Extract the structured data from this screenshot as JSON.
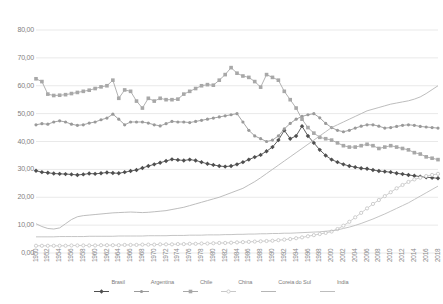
{
  "chart_data": {
    "type": "line",
    "title": "",
    "xlabel": "",
    "ylabel": "",
    "ylim": [
      0,
      80
    ],
    "ytick_step": 10,
    "grid": true,
    "legend_position": "bottom",
    "y_tick_labels": [
      "0,00",
      "10,00",
      "20,00",
      "30,00",
      "40,00",
      "50,00",
      "60,00",
      "70,00",
      "80,00"
    ],
    "x": [
      1950,
      1951,
      1952,
      1953,
      1954,
      1955,
      1956,
      1957,
      1958,
      1959,
      1960,
      1961,
      1962,
      1963,
      1964,
      1965,
      1966,
      1967,
      1968,
      1969,
      1970,
      1971,
      1972,
      1973,
      1974,
      1975,
      1976,
      1977,
      1978,
      1979,
      1980,
      1981,
      1982,
      1983,
      1984,
      1985,
      1986,
      1987,
      1988,
      1989,
      1990,
      1991,
      1992,
      1993,
      1994,
      1995,
      1996,
      1997,
      1998,
      1999,
      2000,
      2001,
      2002,
      2003,
      2004,
      2005,
      2006,
      2007,
      2008,
      2009,
      2010,
      2011,
      2012,
      2013,
      2014,
      2015,
      2016,
      2017,
      2018
    ],
    "x_tick_labels": [
      "1950",
      "1952",
      "1954",
      "1956",
      "1958",
      "1960",
      "1962",
      "1964",
      "1966",
      "1968",
      "1970",
      "1972",
      "1974",
      "1976",
      "1978",
      "1980",
      "1982",
      "1984",
      "1986",
      "1988",
      "1990",
      "1992",
      "1994",
      "1996",
      "1998",
      "2000",
      "2002",
      "2004",
      "2006",
      "2008",
      "2010",
      "2012",
      "2014",
      "2016",
      "2018"
    ],
    "series": [
      {
        "name": "Brasil",
        "color": "#4f4f4f",
        "marker": "diamond",
        "values": [
          29.5,
          29.0,
          28.8,
          28.5,
          28.4,
          28.3,
          28.2,
          28.0,
          28.2,
          28.5,
          28.4,
          28.6,
          28.9,
          28.7,
          28.6,
          29.0,
          29.4,
          29.8,
          30.5,
          31.2,
          31.8,
          32.4,
          33.0,
          33.6,
          33.4,
          33.2,
          33.5,
          33.2,
          32.6,
          32.0,
          31.6,
          31.2,
          31.0,
          31.2,
          31.8,
          32.6,
          33.5,
          34.4,
          35.2,
          36.5,
          38.0,
          40.5,
          44.0,
          41.0,
          42.0,
          45.5,
          42.0,
          39.5,
          37.0,
          35.0,
          33.5,
          32.6,
          31.8,
          31.2,
          30.8,
          30.4,
          30.2,
          29.8,
          29.4,
          29.2,
          29.0,
          28.6,
          28.3,
          28.0,
          27.7,
          27.4,
          27.2,
          27.0,
          26.8
        ]
      },
      {
        "name": "Argentina",
        "color": "#9a9a9a",
        "marker": "circle",
        "values": [
          46.0,
          46.4,
          46.2,
          47.0,
          47.4,
          47.0,
          46.2,
          45.8,
          46.0,
          46.6,
          47.0,
          47.8,
          48.4,
          49.8,
          48.0,
          46.0,
          47.0,
          47.0,
          47.0,
          46.6,
          46.0,
          45.6,
          46.4,
          47.2,
          47.0,
          47.0,
          46.8,
          47.2,
          47.6,
          48.0,
          48.4,
          48.8,
          49.2,
          49.6,
          50.0,
          47.0,
          44.0,
          42.0,
          41.0,
          40.0,
          40.5,
          42.0,
          44.5,
          46.5,
          48.0,
          49.0,
          49.6,
          50.0,
          48.5,
          46.5,
          45.0,
          44.0,
          43.5,
          44.0,
          44.8,
          45.5,
          46.0,
          46.0,
          45.5,
          44.8,
          45.0,
          45.4,
          45.8,
          46.0,
          45.8,
          45.4,
          45.2,
          45.0,
          44.8
        ]
      },
      {
        "name": "Chile",
        "color": "#a8a8a8",
        "marker": "square",
        "values": [
          62.5,
          61.5,
          57.0,
          56.5,
          56.6,
          56.8,
          57.2,
          57.6,
          58.0,
          58.4,
          59.0,
          59.6,
          60.0,
          62.0,
          55.5,
          58.5,
          58.0,
          54.5,
          52.0,
          55.5,
          54.5,
          55.5,
          55.0,
          55.0,
          55.2,
          57.0,
          58.0,
          59.0,
          60.0,
          60.4,
          60.2,
          62.0,
          64.0,
          66.5,
          64.5,
          63.5,
          63.0,
          61.5,
          59.5,
          64.0,
          63.0,
          62.0,
          58.0,
          55.0,
          52.0,
          48.0,
          45.0,
          43.0,
          41.5,
          41.0,
          40.5,
          39.5,
          38.5,
          38.0,
          38.0,
          38.5,
          39.0,
          38.5,
          37.5,
          38.0,
          38.5,
          38.0,
          37.5,
          37.0,
          36.0,
          35.5,
          34.5,
          34.0,
          33.5
        ]
      },
      {
        "name": "China",
        "color": "#c8c8c8",
        "marker": "circle-open",
        "values": [
          2.6,
          2.6,
          2.6,
          2.6,
          2.6,
          2.6,
          2.7,
          2.7,
          2.7,
          2.7,
          2.7,
          2.8,
          2.8,
          2.8,
          2.8,
          2.9,
          2.9,
          2.9,
          3.0,
          3.0,
          3.0,
          3.1,
          3.1,
          3.1,
          3.2,
          3.2,
          3.3,
          3.3,
          3.4,
          3.4,
          3.5,
          3.6,
          3.6,
          3.7,
          3.8,
          3.9,
          4.0,
          4.1,
          4.2,
          4.3,
          4.4,
          4.6,
          4.8,
          5.0,
          5.3,
          5.6,
          6.0,
          6.4,
          6.8,
          7.2,
          7.7,
          8.6,
          9.8,
          11.2,
          12.8,
          14.4,
          16.0,
          17.6,
          19.0,
          20.4,
          21.8,
          23.2,
          24.4,
          25.5,
          26.4,
          27.0,
          27.6,
          28.0,
          28.4
        ]
      },
      {
        "name": "Coreia do Sul",
        "color": "#b5b5b5",
        "marker": "none",
        "values": [
          10.5,
          9.5,
          8.8,
          8.6,
          9.0,
          10.5,
          12.0,
          13.0,
          13.4,
          13.6,
          13.8,
          14.0,
          14.2,
          14.4,
          14.5,
          14.6,
          14.7,
          14.6,
          14.5,
          14.6,
          14.8,
          15.0,
          15.2,
          15.6,
          16.0,
          16.4,
          17.0,
          17.6,
          18.2,
          18.8,
          19.4,
          20.0,
          20.8,
          21.6,
          22.4,
          23.2,
          24.4,
          25.6,
          27.0,
          28.5,
          30.0,
          31.5,
          33.0,
          34.5,
          36.0,
          37.5,
          39.0,
          40.5,
          42.0,
          43.5,
          45.0,
          46.0,
          47.0,
          48.0,
          49.0,
          50.0,
          51.0,
          51.6,
          52.2,
          52.8,
          53.4,
          53.8,
          54.2,
          54.6,
          55.2,
          56.0,
          57.2,
          58.6,
          60.0
        ]
      },
      {
        "name": "India",
        "color": "#bdbdbd",
        "marker": "none",
        "values": [
          5.8,
          5.8,
          5.8,
          5.8,
          5.9,
          5.9,
          5.9,
          5.9,
          5.9,
          6.0,
          6.0,
          6.0,
          6.0,
          6.0,
          6.1,
          6.1,
          6.1,
          6.1,
          6.1,
          6.2,
          6.2,
          6.2,
          6.2,
          6.3,
          6.3,
          6.3,
          6.4,
          6.4,
          6.4,
          6.5,
          6.5,
          6.5,
          6.6,
          6.6,
          6.7,
          6.7,
          6.8,
          6.8,
          6.9,
          6.9,
          7.0,
          7.0,
          7.1,
          7.1,
          7.2,
          7.3,
          7.4,
          7.5,
          7.6,
          7.8,
          8.0,
          8.3,
          8.8,
          9.3,
          9.9,
          10.6,
          11.4,
          12.2,
          13.1,
          14.0,
          15.0,
          16.0,
          17.0,
          18.0,
          19.2,
          20.4,
          21.6,
          22.8,
          24.0
        ]
      }
    ]
  },
  "legend": {
    "items": [
      {
        "label": "Brasil"
      },
      {
        "label": "Argentina"
      },
      {
        "label": "Chile"
      },
      {
        "label": "China"
      },
      {
        "label": "Coreia do Sul"
      },
      {
        "label": "India"
      }
    ]
  }
}
